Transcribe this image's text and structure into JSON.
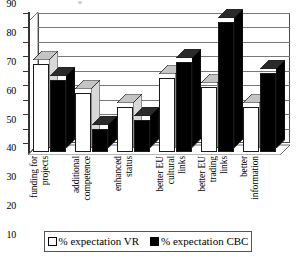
{
  "chart_data": {
    "type": "bar",
    "title": "",
    "subtitle": "",
    "xlabel": "",
    "ylabel": "",
    "ylim": [
      0,
      90
    ],
    "ytick_step": 10,
    "yticks": [
      0,
      10,
      20,
      30,
      40,
      50,
      60,
      70,
      80,
      90
    ],
    "grid": true,
    "legend_position": "bottom",
    "style": "3d-grouped-bar",
    "categories": [
      "funding for projects",
      "additional competence",
      "enhanced status",
      "better EU cultural links",
      "better EU trading links",
      "better information"
    ],
    "category_lines": [
      [
        "funding for",
        "projects"
      ],
      [
        "additional",
        "competence"
      ],
      [
        "enhanced",
        "status"
      ],
      [
        "better EU",
        "cultural",
        "links"
      ],
      [
        "better EU",
        "trading",
        "links"
      ],
      [
        "better",
        "information"
      ]
    ],
    "series": [
      {
        "name": "% expectation VR",
        "fill": "#ffffff",
        "values": [
          61,
          41,
          31,
          51,
          45,
          31
        ]
      },
      {
        "name": "% expectation CBC",
        "fill": "#000000",
        "values": [
          50,
          16,
          22,
          62,
          90,
          55
        ]
      }
    ]
  },
  "legend": {
    "items": [
      {
        "label": "% expectation VR",
        "swatch": "open-square"
      },
      {
        "label": "% expectation CBC",
        "swatch": "filled-square"
      }
    ]
  },
  "colors": {
    "series_vr": "#ffffff",
    "series_cbc": "#000000",
    "axis": "#333333",
    "gridline": "#777777",
    "background": "#ffffff"
  }
}
